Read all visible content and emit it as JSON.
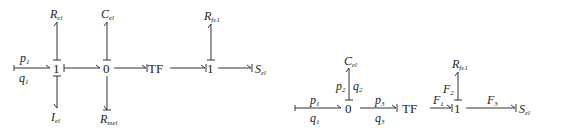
{
  "left_diagram": {
    "input_effort": "p",
    "input_effort_sub": "1",
    "input_flow": "q",
    "input_flow_sub": "1",
    "junction_1": "1",
    "junction_0": "0",
    "transformer": "TF",
    "junction_1b": "1",
    "R_el": "R",
    "R_el_sub": "el",
    "C_el": "C",
    "C_el_sub": "el",
    "I_el": "I",
    "I_el_sub": "el",
    "R_mel": "R",
    "R_mel_sub": "mel",
    "R_fe": "R",
    "R_fe_sub": "fe1",
    "S_el": "S",
    "S_el_sub": "el"
  },
  "right_diagram": {
    "p1": "p",
    "p1_sub": "1",
    "q1": "q",
    "q1_sub": "1",
    "p2": "p",
    "p2_sub": "2",
    "q2": "q",
    "q2_sub": "2",
    "p3": "p",
    "p3_sub": "3",
    "q3": "q",
    "q3_sub": "3",
    "junction_0": "0",
    "transformer": "TF",
    "junction_1": "1",
    "F1": "F",
    "F1_sub": "1",
    "F2": "F",
    "F2_sub": "2",
    "F3": "F",
    "F3_sub": "3",
    "C_el": "C",
    "C_el_sub": "el",
    "R_fe": "R",
    "R_fe_sub": "fe1",
    "S_el": "S",
    "S_el_sub": "el"
  }
}
